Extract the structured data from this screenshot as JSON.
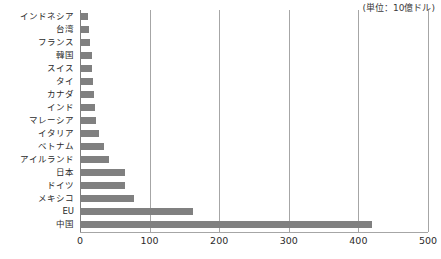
{
  "annotation": {
    "unit_note": "(単位：10億ドル)"
  },
  "chart_data": {
    "type": "bar",
    "orientation": "horizontal",
    "title": "",
    "xlabel": "",
    "ylabel": "",
    "unit_note": "(単位：10億ドル)",
    "xlim": [
      0,
      500
    ],
    "xticks": [
      "0",
      "100",
      "200",
      "300",
      "400",
      "500"
    ],
    "xtick_values": [
      0,
      100,
      200,
      300,
      400,
      500
    ],
    "grid": true,
    "grid_axis": "x",
    "legend": false,
    "bar_color": "#808080",
    "gridline_color": "#a6a6a6",
    "categories": [
      "インドネシア",
      "台湾",
      "フランス",
      "韓国",
      "スイス",
      "タイ",
      "カナダ",
      "インド",
      "マレーシア",
      "イタリア",
      "ベトナム",
      "アイルランド",
      "日本",
      "ドイツ",
      "メキシコ",
      "EU",
      "中国"
    ],
    "values": [
      11,
      13,
      15,
      17,
      17,
      19,
      20,
      21,
      23,
      28,
      34,
      42,
      65,
      65,
      78,
      163,
      420
    ]
  }
}
